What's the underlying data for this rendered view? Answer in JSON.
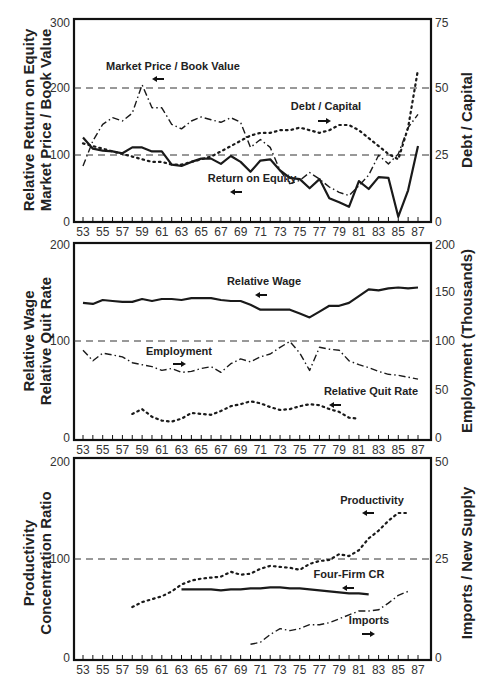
{
  "chart_data": [
    {
      "type": "line",
      "panel": "top",
      "x": [
        53,
        54,
        55,
        56,
        57,
        58,
        59,
        60,
        61,
        62,
        63,
        64,
        65,
        66,
        67,
        68,
        69,
        70,
        71,
        72,
        73,
        74,
        75,
        76,
        77,
        78,
        79,
        80,
        81,
        82,
        83,
        84,
        85,
        86,
        87
      ],
      "left_axis": {
        "label_lines": [
          "Relative Return on Equity",
          "Market Price / Book Value"
        ],
        "ticks": [
          0,
          100,
          200,
          300
        ],
        "ylim": [
          0,
          300
        ]
      },
      "right_axis": {
        "label": "Debt / Capital",
        "ticks": [
          0,
          25,
          50,
          75
        ],
        "ylim": [
          0,
          75
        ]
      },
      "reference_lines": [
        100,
        200
      ],
      "series": [
        {
          "name": "Return on Equity",
          "axis": "left",
          "style": "solid",
          "values": [
            125,
            108,
            105,
            104,
            101,
            110,
            110,
            104,
            104,
            84,
            82,
            88,
            93,
            93,
            85,
            97,
            88,
            73,
            90,
            92,
            75,
            64,
            62,
            48,
            62,
            33,
            27,
            20,
            59,
            47,
            65,
            64,
            5,
            45,
            112
          ]
        },
        {
          "name": "Market Price / Book Value",
          "axis": "left",
          "style": "dash-dot",
          "values": [
            82,
            120,
            145,
            155,
            150,
            162,
            205,
            170,
            170,
            145,
            138,
            150,
            156,
            152,
            148,
            155,
            148,
            110,
            122,
            110,
            75,
            55,
            60,
            72,
            62,
            50,
            42,
            37,
            52,
            68,
            98,
            85,
            100,
            140,
            160
          ]
        },
        {
          "name": "Debt / Capital",
          "axis": "right",
          "style": "dotted",
          "values": [
            29,
            28,
            27,
            26,
            25,
            24,
            23,
            22,
            22,
            21,
            21,
            22,
            23,
            24,
            26,
            28,
            30,
            32,
            33,
            33,
            34,
            34,
            35,
            34,
            33,
            34,
            36,
            36,
            34,
            31,
            28,
            25,
            23,
            35,
            57
          ]
        }
      ],
      "annotations": [
        {
          "text": "Market Price / Book Value",
          "arrow": "left"
        },
        {
          "text": "Debt / Capital",
          "arrow": "right"
        },
        {
          "text": "Return on Equity",
          "arrow": "left"
        }
      ]
    },
    {
      "type": "line",
      "panel": "middle",
      "x": [
        53,
        54,
        55,
        56,
        57,
        58,
        59,
        60,
        61,
        62,
        63,
        64,
        65,
        66,
        67,
        68,
        69,
        70,
        71,
        72,
        73,
        74,
        75,
        76,
        77,
        78,
        79,
        80,
        81,
        82,
        83,
        84,
        85,
        86,
        87
      ],
      "left_axis": {
        "label_lines": [
          "Relative Wage",
          "Relative Quit Rate"
        ],
        "ticks": [
          0,
          100,
          200
        ],
        "ylim": [
          0,
          200
        ]
      },
      "right_axis": {
        "label": "Employment (Thousands)",
        "ticks": [
          0,
          50,
          100,
          150,
          200
        ],
        "ylim": [
          0,
          200
        ]
      },
      "reference_lines": [
        100
      ],
      "series": [
        {
          "name": "Relative Wage",
          "axis": "left",
          "style": "solid",
          "values": [
            140,
            139,
            143,
            142,
            141,
            141,
            144,
            142,
            144,
            144,
            143,
            145,
            145,
            145,
            143,
            142,
            142,
            138,
            133,
            133,
            133,
            133,
            129,
            125,
            131,
            137,
            137,
            140,
            147,
            154,
            153,
            155,
            156,
            155,
            156,
            157,
            158
          ]
        },
        {
          "name": "Employment",
          "axis": "right",
          "style": "dash-dot",
          "values": [
            91,
            80,
            88,
            86,
            84,
            78,
            76,
            74,
            70,
            72,
            68,
            69,
            72,
            74,
            68,
            77,
            82,
            79,
            84,
            87,
            94,
            100,
            88,
            70,
            94,
            92,
            91,
            80,
            76,
            73,
            69,
            66,
            65,
            63,
            61
          ]
        },
        {
          "name": "Relative Quit Rate",
          "axis": "left",
          "style": "dotted",
          "x": [
            58,
            59,
            60,
            61,
            62,
            63,
            64,
            65,
            66,
            67,
            68,
            69,
            70,
            71,
            72,
            73,
            74,
            75,
            76,
            77,
            78,
            79,
            80,
            81
          ],
          "values": [
            25,
            30,
            22,
            18,
            17,
            20,
            26,
            25,
            24,
            28,
            33,
            35,
            38,
            36,
            32,
            29,
            30,
            33,
            35,
            34,
            30,
            27,
            21,
            20
          ]
        }
      ],
      "annotations": [
        {
          "text": "Relative Wage",
          "arrow": "left"
        },
        {
          "text": "Employment",
          "arrow": "right"
        },
        {
          "text": "Relative Quit Rate",
          "arrow": "left"
        }
      ]
    },
    {
      "type": "line",
      "panel": "bottom",
      "x": [
        53,
        54,
        55,
        56,
        57,
        58,
        59,
        60,
        61,
        62,
        63,
        64,
        65,
        66,
        67,
        68,
        69,
        70,
        71,
        72,
        73,
        74,
        75,
        76,
        77,
        78,
        79,
        80,
        81,
        82,
        83,
        84,
        85,
        86,
        87
      ],
      "left_axis": {
        "label_lines": [
          "Productivity",
          "Concentration Ratio"
        ],
        "ticks": [
          0,
          100,
          200
        ],
        "ylim": [
          0,
          200
        ]
      },
      "right_axis": {
        "label": "Imports / New Supply",
        "ticks": [
          0,
          25,
          50
        ],
        "ylim": [
          0,
          50
        ]
      },
      "reference_lines": [
        100
      ],
      "series": [
        {
          "name": "Productivity",
          "axis": "left",
          "style": "dotted",
          "x": [
            58,
            59,
            60,
            61,
            62,
            63,
            64,
            65,
            66,
            67,
            68,
            69,
            70,
            71,
            72,
            73,
            74,
            75,
            76,
            77,
            78,
            79,
            80,
            81,
            82,
            83,
            84,
            85,
            86
          ],
          "values": [
            52,
            57,
            60,
            63,
            68,
            75,
            79,
            81,
            82,
            83,
            88,
            85,
            86,
            91,
            94,
            93,
            92,
            90,
            96,
            99,
            100,
            106,
            104,
            110,
            122,
            130,
            140,
            148,
            148
          ]
        },
        {
          "name": "Four-Firm CR",
          "axis": "left",
          "style": "solid",
          "x": [
            63,
            64,
            65,
            66,
            67,
            68,
            69,
            70,
            71,
            72,
            73,
            74,
            75,
            76,
            77,
            78,
            79,
            80,
            81,
            82
          ],
          "values": [
            70,
            70,
            70,
            70,
            69,
            70,
            70,
            71,
            71,
            72,
            72,
            71,
            71,
            70,
            69,
            68,
            67,
            66,
            66,
            65
          ]
        },
        {
          "name": "Imports",
          "axis": "right",
          "style": "dash-dot",
          "x": [
            70,
            71,
            72,
            73,
            74,
            75,
            76,
            77,
            78,
            79,
            80,
            81,
            82,
            83,
            84,
            85,
            86
          ],
          "values": [
            3.5,
            4,
            6,
            7.5,
            7,
            7.5,
            8.5,
            8.5,
            9,
            10,
            11,
            12,
            12,
            12.3,
            14,
            16,
            17
          ]
        }
      ],
      "annotations": [
        {
          "text": "Productivity",
          "arrow": "left"
        },
        {
          "text": "Four-Firm CR",
          "arrow": "left"
        },
        {
          "text": "Imports",
          "arrow": "right"
        }
      ]
    }
  ],
  "x_tick_labels": [
    "53",
    "55",
    "57",
    "59",
    "61",
    "63",
    "65",
    "67",
    "69",
    "71",
    "73",
    "75",
    "77",
    "79",
    "81",
    "83",
    "85",
    "87"
  ],
  "panels": {
    "top": {
      "left_title_1": "Relative Return on Equity",
      "left_title_2": "Market Price / Book Value",
      "right_title": "Debt / Capital",
      "left_ticks": [
        "0",
        "100",
        "200",
        "300"
      ],
      "right_ticks": [
        "0",
        "25",
        "50",
        "75"
      ],
      "label_mpbv": "Market Price / Book Value",
      "label_debt": "Debt / Capital",
      "label_roe": "Return on Equity"
    },
    "middle": {
      "left_title_1": "Relative Wage",
      "left_title_2": "Relative Quit Rate",
      "right_title": "Employment (Thousands)",
      "left_ticks": [
        "0",
        "100",
        "200"
      ],
      "right_ticks": [
        "0",
        "50",
        "100",
        "150",
        "200"
      ],
      "label_wage": "Relative Wage",
      "label_employment": "Employment",
      "label_quit": "Relative Quit Rate"
    },
    "bottom": {
      "left_title_1": "Productivity",
      "left_title_2": "Concentration Ratio",
      "right_title": "Imports / New Supply",
      "left_ticks": [
        "0",
        "100",
        "200"
      ],
      "right_ticks": [
        "0",
        "25",
        "50"
      ],
      "label_productivity": "Productivity",
      "label_cr": "Four-Firm CR",
      "label_imports": "Imports"
    }
  },
  "colors": {
    "line": "#1a1a1a",
    "frame": "#111111",
    "text": "#222222"
  }
}
